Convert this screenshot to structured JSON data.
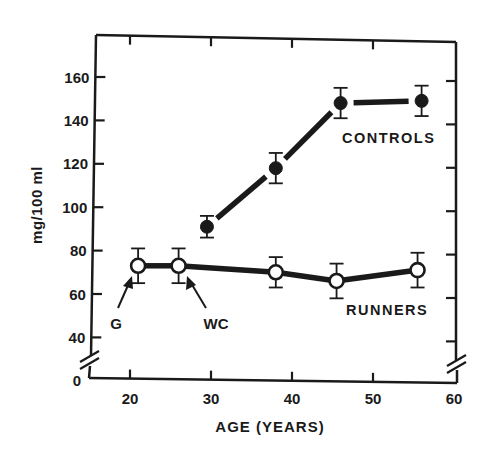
{
  "chart_data": {
    "type": "line",
    "title": "",
    "xlabel": "AGE (YEARS)",
    "ylabel": "mg/100 ml",
    "xlim": [
      15,
      60
    ],
    "ylim": [
      0,
      170
    ],
    "y_axis_break": [
      0,
      30
    ],
    "x_ticks": [
      20,
      30,
      40,
      50,
      60
    ],
    "x_tick_labels": [
      "20",
      "30",
      "40",
      "50",
      "60"
    ],
    "y_ticks": [
      40,
      60,
      80,
      100,
      120,
      140,
      160
    ],
    "y_tick_labels": [
      "0",
      "40",
      "60",
      "80",
      "100",
      "120",
      "140",
      "160"
    ],
    "grid": false,
    "legend": "inline labels",
    "series": [
      {
        "name": "CONTROLS",
        "marker": "filled-circle",
        "x": [
          29.5,
          38,
          46,
          56
        ],
        "values": [
          91,
          118,
          148,
          149
        ],
        "error": [
          5,
          7,
          7,
          7
        ]
      },
      {
        "name": "RUNNERS",
        "marker": "open-circle",
        "x": [
          21,
          26,
          38,
          45.5,
          55.5
        ],
        "values": [
          73,
          73,
          70,
          66,
          71
        ],
        "error": [
          8,
          8,
          7,
          8,
          8
        ]
      }
    ],
    "annotations": [
      {
        "text": "G",
        "points_to": {
          "series": "RUNNERS",
          "index": 0
        }
      },
      {
        "text": "WC",
        "points_to": {
          "series": "RUNNERS",
          "index": 1
        }
      }
    ]
  },
  "labels": {
    "controls": "CONTROLS",
    "runners": "RUNNERS",
    "g": "G",
    "wc": "WC",
    "xlabel": "AGE (YEARS)",
    "ylabel": "mg/100 ml",
    "zero": "0"
  },
  "colors": {
    "ink": "#1a1a1a",
    "background": "#ffffff"
  }
}
